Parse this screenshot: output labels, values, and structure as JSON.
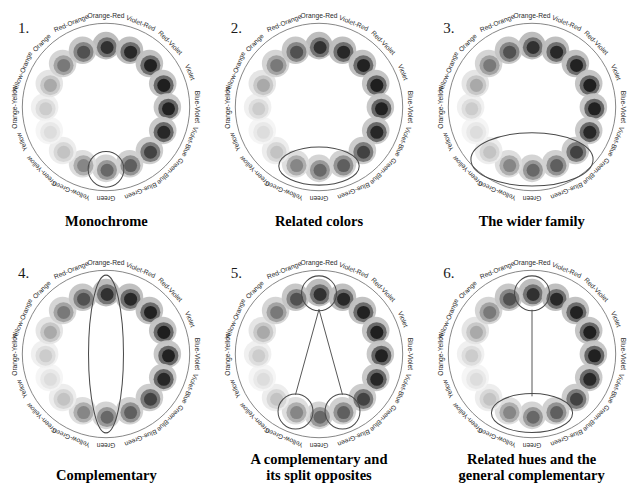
{
  "figure": {
    "background": "#ffffff",
    "panel_count": 6
  },
  "wheel": {
    "hue_count": 16,
    "outer_ring_color": "#8a8a8a",
    "hues": [
      {
        "name": "Orange-Red",
        "angle": 0,
        "outer": "#b9b9b9",
        "mid": "#6f6f6f",
        "inner": "#2d2d2d"
      },
      {
        "name": "Violet-Red",
        "angle": 22.5,
        "outer": "#bcbcbc",
        "mid": "#6a6a6a",
        "inner": "#242424"
      },
      {
        "name": "Red-Violet",
        "angle": 45,
        "outer": "#bfbfbf",
        "mid": "#676767",
        "inner": "#1f1f1f"
      },
      {
        "name": "Violet",
        "angle": 67.5,
        "outer": "#c2c2c2",
        "mid": "#636363",
        "inner": "#1b1b1b"
      },
      {
        "name": "Blue-Violet",
        "angle": 90,
        "outer": "#c4c4c4",
        "mid": "#616161",
        "inner": "#1d1d1d"
      },
      {
        "name": "Violet-Blue",
        "angle": 112.5,
        "outer": "#c6c6c6",
        "mid": "#646464",
        "inner": "#242424"
      },
      {
        "name": "Green-Blue",
        "angle": 135,
        "outer": "#c9c9c9",
        "mid": "#777777",
        "inner": "#3f3f3f"
      },
      {
        "name": "Blue-Green",
        "angle": 157.5,
        "outer": "#cfcfcf",
        "mid": "#8e8e8e",
        "inner": "#5d5d5d"
      },
      {
        "name": "Green",
        "angle": 180,
        "outer": "#d2d2d2",
        "mid": "#969696",
        "inner": "#656565"
      },
      {
        "name": "Yellow-Green",
        "angle": 202.5,
        "outer": "#dcdcdc",
        "mid": "#ababab",
        "inner": "#848484"
      },
      {
        "name": "Green-Yellow",
        "angle": 225,
        "outer": "#ececec",
        "mid": "#d6d6d6",
        "inner": "#c2c2c2"
      },
      {
        "name": "Yellow",
        "angle": 247.5,
        "outer": "#f4f4f4",
        "mid": "#e8e8e8",
        "inner": "#dcdcdc"
      },
      {
        "name": "Orange-Yellow",
        "angle": 270,
        "outer": "#efefef",
        "mid": "#dcdcdc",
        "inner": "#cacaca"
      },
      {
        "name": "Yellow-Orange",
        "angle": 292.5,
        "outer": "#e4e4e4",
        "mid": "#c6c6c6",
        "inner": "#a8a8a8"
      },
      {
        "name": "Orange",
        "angle": 315,
        "outer": "#d3d3d3",
        "mid": "#a0a0a0",
        "inner": "#777777"
      },
      {
        "name": "Red-Orange",
        "angle": 337.5,
        "outer": "#c4c4c4",
        "mid": "#838383",
        "inner": "#4e4e4e"
      }
    ]
  },
  "panels": [
    {
      "number": "1.",
      "caption": "Monochrome",
      "scheme": "monochrome",
      "highlight_type": "circle",
      "highlighted": [
        "Green"
      ]
    },
    {
      "number": "2.",
      "caption": "Related colors",
      "scheme": "analogous",
      "highlight_type": "ellipse-small",
      "highlighted": [
        "Yellow-Green",
        "Green",
        "Blue-Green"
      ]
    },
    {
      "number": "3.",
      "caption": "The wider family",
      "scheme": "extended-analogous",
      "highlight_type": "ellipse-large",
      "highlighted": [
        "Green-Yellow",
        "Yellow-Green",
        "Green",
        "Blue-Green",
        "Green-Blue"
      ]
    },
    {
      "number": "4.",
      "caption": "Complementary",
      "scheme": "complementary",
      "highlight_type": "ellipse-vertical",
      "highlighted": [
        "Orange-Red",
        "Green"
      ]
    },
    {
      "number": "5.",
      "caption": "A complementary and\nits split opposites",
      "scheme": "split-complementary",
      "highlight_type": "circles-with-lines",
      "highlighted": [
        "Orange-Red",
        "Yellow-Green",
        "Blue-Green"
      ]
    },
    {
      "number": "6.",
      "caption": "Related hues and the\ngeneral complementary",
      "scheme": "analogous-plus-complement",
      "highlight_type": "circle-line-ellipse",
      "highlighted": [
        "Orange-Red",
        "Yellow-Green",
        "Green",
        "Blue-Green"
      ]
    }
  ]
}
